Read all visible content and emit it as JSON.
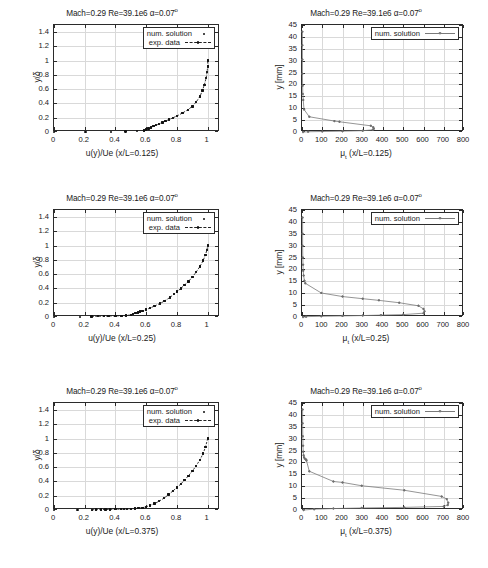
{
  "figure": {
    "caption": "",
    "panel_title": "Mach=0.29 Re=39.1e6 α=0.07",
    "degree_symbol": "o"
  },
  "legend": {
    "num_solution": "num. solution",
    "exp_data": "exp. data"
  },
  "chart_data": [
    {
      "type": "scatter",
      "id": "velocity-profile-0125",
      "title": "Mach=0.29 Re=39.1e6 α=0.07°",
      "xlabel": "u(y)/Ue (x/L=0.125)",
      "ylabel": "y/δ",
      "xlim": [
        0,
        1.08
      ],
      "ylim": [
        0,
        1.5
      ],
      "xticks": [
        0,
        0.2,
        0.4,
        0.6,
        0.8,
        1
      ],
      "yticks": [
        0,
        0.2,
        0.4,
        0.6,
        0.8,
        1,
        1.2,
        1.4
      ],
      "grid": true,
      "legend_position": "top-right",
      "series": [
        {
          "name": "num. solution",
          "style": "points",
          "x": [
            0.0,
            0.205,
            0.37,
            0.465,
            0.54,
            0.585,
            0.6,
            0.615,
            0.63,
            0.648,
            0.665,
            0.685,
            0.705,
            0.725,
            0.75,
            0.775,
            0.8,
            0.835,
            0.87,
            0.9,
            0.925,
            0.95,
            0.965,
            0.978,
            0.99,
            0.996,
            1.0,
            1.0
          ],
          "y": [
            0.0,
            0.0,
            0.0,
            0.005,
            0.012,
            0.022,
            0.035,
            0.05,
            0.065,
            0.08,
            0.095,
            0.115,
            0.135,
            0.155,
            0.175,
            0.2,
            0.225,
            0.265,
            0.31,
            0.36,
            0.42,
            0.5,
            0.58,
            0.66,
            0.76,
            0.84,
            0.92,
            1.0
          ]
        },
        {
          "name": "exp. data",
          "style": "linespoints",
          "x": [
            0.585,
            0.6,
            0.615,
            0.63,
            0.648,
            0.665,
            0.685,
            0.705,
            0.725,
            0.75,
            0.775,
            0.8,
            0.835,
            0.87,
            0.9,
            0.925,
            0.95,
            0.965,
            0.978,
            0.99,
            0.996,
            1.0,
            1.0
          ],
          "y": [
            0.022,
            0.035,
            0.05,
            0.065,
            0.08,
            0.095,
            0.115,
            0.135,
            0.155,
            0.175,
            0.2,
            0.225,
            0.265,
            0.31,
            0.36,
            0.42,
            0.5,
            0.58,
            0.66,
            0.76,
            0.84,
            0.92,
            1.0
          ]
        }
      ]
    },
    {
      "type": "line",
      "id": "turbulent-viscosity-0125",
      "title": "Mach=0.29 Re=39.1e6 α=0.07°",
      "xlabel": "μ_t (x/L=0.125)",
      "ylabel": "y [mm]",
      "xlim": [
        0,
        800
      ],
      "ylim": [
        0,
        45
      ],
      "xticks": [
        0,
        100,
        200,
        300,
        400,
        500,
        600,
        700,
        800
      ],
      "yticks": [
        0,
        5,
        10,
        15,
        20,
        25,
        30,
        35,
        40,
        45
      ],
      "grid": true,
      "legend_position": "top-right",
      "series": [
        {
          "name": "num. solution",
          "style": "linespoints",
          "x": [
            2,
            2,
            2,
            2,
            3,
            4,
            6,
            10,
            36,
            160,
            185,
            340,
            352,
            355,
            350,
            300,
            200,
            100,
            30,
            5
          ],
          "y": [
            42.2,
            36.5,
            30.5,
            24.5,
            19.5,
            16.0,
            13.5,
            9.5,
            6.4,
            4.6,
            4.3,
            2.6,
            2.0,
            1.4,
            0.9,
            0.55,
            0.35,
            0.2,
            0.1,
            0.0
          ]
        }
      ]
    },
    {
      "type": "scatter",
      "id": "velocity-profile-025",
      "title": "Mach=0.29 Re=39.1e6 α=0.07°",
      "xlabel": "u(y)/Ue (x/L=0.25)",
      "ylabel": "y/δ",
      "xlim": [
        0,
        1.08
      ],
      "ylim": [
        0,
        1.5
      ],
      "xticks": [
        0,
        0.2,
        0.4,
        0.6,
        0.8,
        1
      ],
      "yticks": [
        0,
        0.2,
        0.4,
        0.6,
        0.8,
        1,
        1.2,
        1.4
      ],
      "grid": true,
      "legend_position": "top-right",
      "series": [
        {
          "name": "num. solution",
          "style": "points",
          "x": [
            0.0,
            0.168,
            0.245,
            0.285,
            0.325,
            0.355,
            0.4,
            0.44,
            0.468,
            0.5,
            0.515,
            0.53,
            0.545,
            0.56,
            0.575,
            0.6,
            0.625,
            0.655,
            0.69,
            0.72,
            0.755,
            0.78,
            0.8,
            0.825,
            0.85,
            0.875,
            0.9,
            0.925,
            0.95,
            0.97,
            0.985,
            0.995,
            1.0
          ],
          "y": [
            0.0,
            0.0,
            0.008,
            0.01,
            0.012,
            0.014,
            0.016,
            0.018,
            0.02,
            0.03,
            0.04,
            0.055,
            0.065,
            0.075,
            0.085,
            0.105,
            0.125,
            0.155,
            0.19,
            0.225,
            0.275,
            0.32,
            0.355,
            0.4,
            0.45,
            0.5,
            0.56,
            0.63,
            0.71,
            0.79,
            0.87,
            0.94,
            1.0
          ]
        },
        {
          "name": "exp. data",
          "style": "linespoints",
          "x": [
            0.245,
            0.285,
            0.325,
            0.355,
            0.4,
            0.44,
            0.468,
            0.5,
            0.515,
            0.53,
            0.545,
            0.56,
            0.575,
            0.6,
            0.625,
            0.655,
            0.69,
            0.72,
            0.755,
            0.78,
            0.8,
            0.825,
            0.85,
            0.875,
            0.9,
            0.925,
            0.95,
            0.97,
            0.985,
            0.995,
            1.0
          ],
          "y": [
            0.008,
            0.01,
            0.012,
            0.014,
            0.016,
            0.018,
            0.02,
            0.03,
            0.04,
            0.055,
            0.065,
            0.075,
            0.085,
            0.105,
            0.125,
            0.155,
            0.19,
            0.225,
            0.275,
            0.32,
            0.355,
            0.4,
            0.45,
            0.5,
            0.56,
            0.63,
            0.71,
            0.79,
            0.87,
            0.94,
            1.0
          ]
        }
      ]
    },
    {
      "type": "line",
      "id": "turbulent-viscosity-025",
      "title": "Mach=0.29 Re=39.1e6 α=0.07°",
      "xlabel": "μ_t (x/L=0.25)",
      "ylabel": "y [mm]",
      "xlim": [
        0,
        800
      ],
      "ylim": [
        0,
        45
      ],
      "xticks": [
        0,
        100,
        200,
        300,
        400,
        500,
        600,
        700,
        800
      ],
      "yticks": [
        0,
        5,
        10,
        15,
        20,
        25,
        30,
        35,
        40,
        45
      ],
      "grid": true,
      "legend_position": "top-right",
      "series": [
        {
          "name": "num. solution",
          "style": "linespoints",
          "x": [
            3,
            3,
            3,
            4,
            5,
            6,
            8,
            12,
            16,
            95,
            200,
            300,
            380,
            480,
            575,
            600,
            605,
            600,
            500,
            390,
            300,
            200,
            95,
            20,
            5
          ],
          "y": [
            41.8,
            35.0,
            30.0,
            25.0,
            22.0,
            19.5,
            17.5,
            15.2,
            14.2,
            10.1,
            8.6,
            7.7,
            7.0,
            6.0,
            4.7,
            3.4,
            2.4,
            1.6,
            1.0,
            0.8,
            0.6,
            0.45,
            0.3,
            0.15,
            0.0
          ]
        }
      ]
    },
    {
      "type": "scatter",
      "id": "velocity-profile-0375",
      "title": "Mach=0.29 Re=39.1e6 α=0.07°",
      "xlabel": "u(y)/Ue (x/L=0.375)",
      "ylabel": "y/δ",
      "xlim": [
        0,
        1.08
      ],
      "ylim": [
        0,
        1.5
      ],
      "xticks": [
        0,
        0.2,
        0.4,
        0.6,
        0.8,
        1
      ],
      "yticks": [
        0,
        0.2,
        0.4,
        0.6,
        0.8,
        1,
        1.2,
        1.4
      ],
      "grid": true,
      "legend_position": "top-right",
      "series": [
        {
          "name": "num. solution",
          "style": "points",
          "x": [
            0.0,
            0.152,
            0.248,
            0.275,
            0.305,
            0.335,
            0.365,
            0.4,
            0.435,
            0.455,
            0.475,
            0.5,
            0.525,
            0.55,
            0.575,
            0.6,
            0.625,
            0.655,
            0.685,
            0.715,
            0.745,
            0.775,
            0.8,
            0.825,
            0.85,
            0.875,
            0.9,
            0.925,
            0.95,
            0.97,
            0.985,
            1.0
          ],
          "y": [
            0.0,
            0.0,
            0.004,
            0.005,
            0.006,
            0.007,
            0.008,
            0.01,
            0.012,
            0.014,
            0.016,
            0.018,
            0.02,
            0.025,
            0.032,
            0.045,
            0.065,
            0.09,
            0.125,
            0.165,
            0.215,
            0.27,
            0.315,
            0.365,
            0.42,
            0.48,
            0.545,
            0.62,
            0.705,
            0.79,
            0.88,
            1.0
          ]
        },
        {
          "name": "exp. data",
          "style": "linespoints",
          "x": [
            0.248,
            0.275,
            0.305,
            0.335,
            0.365,
            0.4,
            0.435,
            0.455,
            0.475,
            0.5,
            0.525,
            0.55,
            0.575,
            0.6,
            0.625,
            0.655,
            0.685,
            0.715,
            0.745,
            0.775,
            0.8,
            0.825,
            0.85,
            0.875,
            0.9,
            0.925,
            0.95,
            0.97,
            0.985,
            1.0
          ],
          "y": [
            0.004,
            0.005,
            0.006,
            0.007,
            0.008,
            0.01,
            0.012,
            0.014,
            0.016,
            0.018,
            0.02,
            0.025,
            0.032,
            0.045,
            0.065,
            0.09,
            0.125,
            0.165,
            0.215,
            0.27,
            0.315,
            0.365,
            0.42,
            0.48,
            0.545,
            0.62,
            0.705,
            0.79,
            0.88,
            1.0
          ]
        }
      ]
    },
    {
      "type": "line",
      "id": "turbulent-viscosity-0375",
      "title": "Mach=0.29 Re=39.1e6 α=0.07°",
      "xlabel": "μ_t (x/L=0.375)",
      "ylabel": "y [mm]",
      "xlim": [
        0,
        800
      ],
      "ylim": [
        0,
        45
      ],
      "xticks": [
        0,
        100,
        200,
        300,
        400,
        500,
        600,
        700,
        800
      ],
      "yticks": [
        0,
        5,
        10,
        15,
        20,
        25,
        30,
        35,
        40,
        45
      ],
      "grid": true,
      "legend_position": "top-right",
      "series": [
        {
          "name": "num. solution",
          "style": "linespoints",
          "x": [
            3,
            3,
            4,
            5,
            6,
            8,
            10,
            14,
            20,
            22,
            36,
            155,
            200,
            295,
            505,
            690,
            715,
            722,
            720,
            700,
            505,
            295,
            155,
            60,
            8
          ],
          "y": [
            42.3,
            36.5,
            31.0,
            27.0,
            24.5,
            23.0,
            22.2,
            21.6,
            21.2,
            20.8,
            16.3,
            12.0,
            11.6,
            10.2,
            8.3,
            5.7,
            4.6,
            3.0,
            2.1,
            1.5,
            1.1,
            0.85,
            0.6,
            0.35,
            0.0
          ]
        }
      ]
    }
  ],
  "axis_parts": {
    "mu_symbol": "μ",
    "mu_subscript": "t",
    "y_mm": "y [mm]",
    "y_delta": "y/δ"
  }
}
